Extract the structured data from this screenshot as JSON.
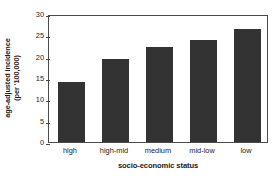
{
  "chart_data": {
    "type": "bar",
    "title": "",
    "categories": [
      "high",
      "high-mid",
      "medium",
      "mid-low",
      "low"
    ],
    "values": [
      14.1,
      19.5,
      22.3,
      23.9,
      26.5
    ],
    "xlabel": "socio-economic status",
    "ylabel_line1": "age-adjusted incidence",
    "ylabel_line2": "(per '100,000)",
    "ylabel": "age-adjusted incidence (per '100,000)",
    "ylim": [
      0,
      30
    ],
    "yticks": [
      0,
      5,
      10,
      15,
      20,
      25,
      30
    ],
    "ytick_labels": [
      "0",
      "5",
      "10",
      "15",
      "20",
      "25",
      "30"
    ],
    "grid": false,
    "legend": false,
    "bar_color": "#333333",
    "axis_color": "#4a4a4a",
    "background_color": "#ffffff"
  }
}
